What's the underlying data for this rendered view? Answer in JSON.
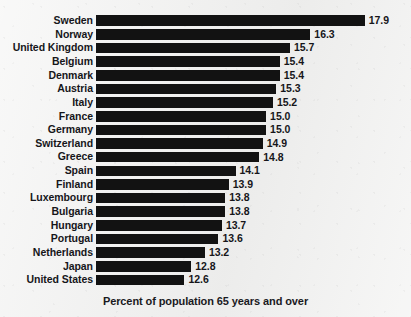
{
  "chart_data": {
    "type": "bar",
    "orientation": "horizontal",
    "title": "",
    "subtitle": "",
    "xlabel": "Percent of population 65 years and over",
    "ylabel": "",
    "grid": false,
    "legend": "none",
    "value_labels_shown": true,
    "value_label_format": "one decimal",
    "xlim": [
      10.0,
      18.2
    ],
    "categories": [
      "Sweden",
      "Norway",
      "United Kingdom",
      "Belgium",
      "Denmark",
      "Austria",
      "Italy",
      "France",
      "Germany",
      "Switzerland",
      "Greece",
      "Spain",
      "Finland",
      "Luxembourg",
      "Bulgaria",
      "Hungary",
      "Portugal",
      "Netherlands",
      "Japan",
      "United States"
    ],
    "values": [
      17.9,
      16.3,
      15.7,
      15.4,
      15.4,
      15.3,
      15.2,
      15.0,
      15.0,
      14.9,
      14.8,
      14.1,
      13.9,
      13.8,
      13.8,
      13.7,
      13.6,
      13.2,
      12.8,
      12.6
    ],
    "value_labels": [
      "17.9",
      "16.3",
      "15.7",
      "15.4",
      "15.4",
      "15.3",
      "15.2",
      "15.0",
      "15.0",
      "14.9",
      "14.8",
      "14.1",
      "13.9",
      "13.8",
      "13.8",
      "13.7",
      "13.6",
      "13.2",
      "12.8",
      "12.6"
    ],
    "bar_color": "#121212",
    "background_color": "#f1f1f0",
    "text_color": "#16161a"
  },
  "caption": {
    "text": "Percent of population 65 years and over"
  }
}
